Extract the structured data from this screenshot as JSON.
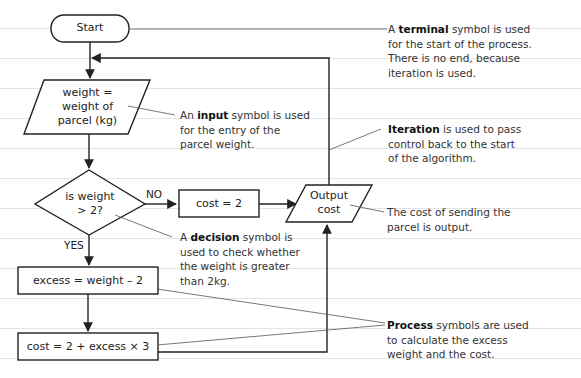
{
  "diagram": {
    "nodes": {
      "start": {
        "type": "terminal",
        "label": "Start"
      },
      "input": {
        "type": "input",
        "lines": [
          "weight =",
          "weight of",
          "parcel (kg)"
        ]
      },
      "decision": {
        "type": "decision",
        "lines": [
          "is weight",
          "> 2?"
        ]
      },
      "cost_two": {
        "type": "process",
        "label": "cost = 2"
      },
      "output": {
        "type": "output",
        "lines": [
          "Output",
          "cost"
        ]
      },
      "excess": {
        "type": "process",
        "label": "excess = weight – 2"
      },
      "cost_calc": {
        "type": "process",
        "label": "cost = 2 + excess × 3"
      }
    },
    "branch_labels": {
      "no": "NO",
      "yes": "YES"
    },
    "annotations": {
      "terminal": {
        "bold": "terminal",
        "pre": "A ",
        "post": " symbol is used",
        "lines": [
          "for the start of the process.",
          "There is no end, because",
          "iteration is used."
        ]
      },
      "input": {
        "bold": "input",
        "pre": "An ",
        "post": " symbol is used",
        "lines": [
          "for the entry of the",
          "parcel weight."
        ]
      },
      "iteration": {
        "bold": "Iteration",
        "pre": "",
        "post": " is used to pass",
        "lines": [
          "control back to the start",
          "of the algorithm."
        ]
      },
      "output": {
        "pre": "The cost of sending the",
        "lines": [
          "parcel is output."
        ]
      },
      "decision": {
        "bold": "decision",
        "pre": "A ",
        "post": " symbol is",
        "lines": [
          "used to check whether",
          "the weight is greater",
          "than 2kg."
        ]
      },
      "process": {
        "bold": "Process",
        "pre": "",
        "post": " symbols are used",
        "lines": [
          "to calculate the excess",
          "weight and the cost."
        ]
      }
    }
  }
}
